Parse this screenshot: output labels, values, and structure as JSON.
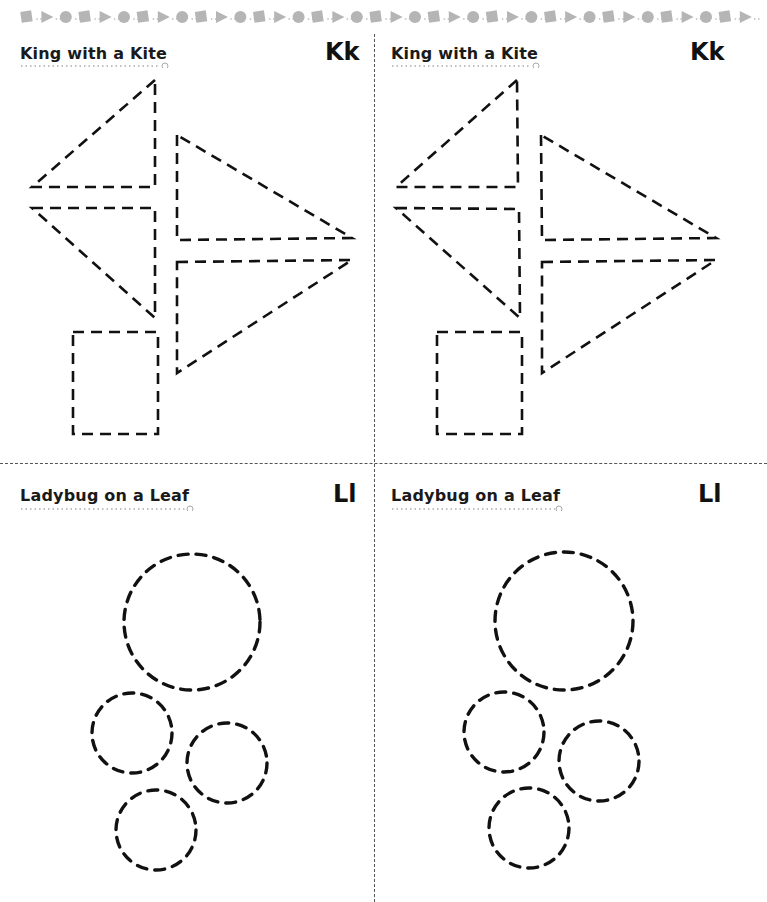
{
  "page": {
    "border_pattern": [
      "square",
      "triangle",
      "circle"
    ],
    "border_color": "#b5b5b5",
    "line_color": "#111111"
  },
  "panels": [
    {
      "title": "King with a Kite",
      "letter": "Kk"
    },
    {
      "title": "King with a Kite",
      "letter": "Kk"
    },
    {
      "title": "Ladybug on a Leaf",
      "letter": "Ll"
    },
    {
      "title": "Ladybug on a Leaf",
      "letter": "Ll"
    }
  ]
}
